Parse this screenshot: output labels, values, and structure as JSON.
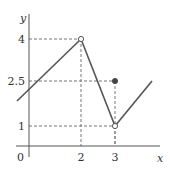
{
  "chart_data": {
    "type": "line",
    "title": "",
    "xlabel": "x",
    "ylabel": "y",
    "origin_label": "0",
    "x_ticks": [
      {
        "value": 2,
        "label": "2"
      },
      {
        "value": 3,
        "label": "3"
      }
    ],
    "y_ticks": [
      {
        "value": 1,
        "label": "1"
      },
      {
        "value": 2.5,
        "label": "2.5"
      },
      {
        "value": 4,
        "label": "4"
      }
    ],
    "series": [
      {
        "name": "segment-1",
        "points": [
          [
            -0.45,
            1.75
          ],
          [
            2,
            4
          ]
        ],
        "end": "open"
      },
      {
        "name": "segment-2",
        "points": [
          [
            2,
            4
          ],
          [
            3,
            1
          ]
        ],
        "end": "open"
      },
      {
        "name": "segment-3",
        "points": [
          [
            3,
            1
          ],
          [
            4.1,
            2.5
          ]
        ],
        "start": "open"
      }
    ],
    "special_points": [
      {
        "x": 2,
        "y": 4,
        "style": "open"
      },
      {
        "x": 3,
        "y": 1,
        "style": "open"
      },
      {
        "x": 3,
        "y": 2.5,
        "style": "filled"
      }
    ],
    "guide_lines": [
      {
        "x": 2,
        "y": 4
      },
      {
        "x": 3,
        "y": 2.5
      },
      {
        "x": 3,
        "y": 1
      }
    ],
    "colors": {
      "line": "#555555",
      "axis": "#555555",
      "guide": "#777777"
    }
  }
}
